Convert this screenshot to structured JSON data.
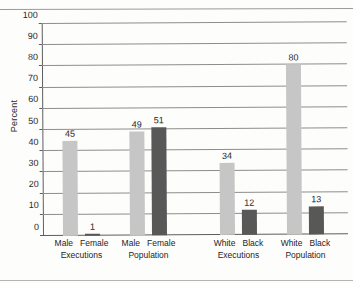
{
  "scan": {
    "caption_fragment_left": "",
    "caption_fragment_right": ""
  },
  "chart_data": {
    "type": "bar",
    "title": "",
    "xlabel": "",
    "ylabel": "Percent",
    "ylim": [
      0,
      100
    ],
    "ytick_step": 10,
    "ytick_labels": [
      "0",
      "10",
      "20",
      "30",
      "40",
      "50",
      "60",
      "70",
      "80",
      "90",
      "100"
    ],
    "grid": true,
    "legend": "none",
    "groups": [
      {
        "group_label": "Executions",
        "bars": [
          {
            "category": "Male",
            "value": 45,
            "label": "45",
            "shade": "light"
          },
          {
            "category": "Female",
            "value": 1,
            "label": "1",
            "shade": "dark"
          }
        ]
      },
      {
        "group_label": "Population",
        "bars": [
          {
            "category": "Male",
            "value": 49,
            "label": "49",
            "shade": "light"
          },
          {
            "category": "Female",
            "value": 51,
            "label": "51",
            "shade": "dark"
          }
        ]
      },
      {
        "group_label": "Executions",
        "bars": [
          {
            "category": "White",
            "value": 34,
            "label": "34",
            "shade": "light"
          },
          {
            "category": "Black",
            "value": 12,
            "label": "12",
            "shade": "dark"
          }
        ]
      },
      {
        "group_label": "Population",
        "bars": [
          {
            "category": "White",
            "value": 80,
            "label": "80",
            "shade": "light"
          },
          {
            "category": "Black",
            "value": 13,
            "label": "13",
            "shade": "dark"
          }
        ]
      }
    ],
    "colors": {
      "light_bar": "#c6c6c6",
      "dark_bar": "#585858",
      "gridline": "#8d8d8d",
      "axis": "#5d5d5d",
      "text": "#1e1e1e",
      "background": "#fdfdfc"
    }
  }
}
